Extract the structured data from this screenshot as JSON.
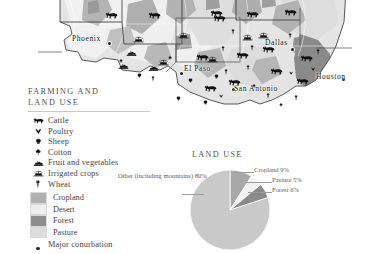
{
  "map": {
    "name": "southwest-usa-farming-map",
    "cities": [
      {
        "name": "Phoenix",
        "x": 93,
        "y": 40
      },
      {
        "name": "El Paso",
        "x": 186,
        "y": 70
      },
      {
        "name": "Dallas",
        "x": 275,
        "y": 44
      },
      {
        "name": "San Antonio",
        "x": 237,
        "y": 91
      },
      {
        "name": "Houston",
        "x": 319,
        "y": 77
      }
    ],
    "icons": [
      {
        "kind": "cattle",
        "x": 105,
        "y": 6
      },
      {
        "kind": "cattle",
        "x": 148,
        "y": 6
      },
      {
        "kind": "cattle",
        "x": 210,
        "y": 4
      },
      {
        "kind": "cattle",
        "x": 246,
        "y": 5
      },
      {
        "kind": "cattle",
        "x": 284,
        "y": 3
      },
      {
        "kind": "cattle",
        "x": 213,
        "y": 9
      },
      {
        "kind": "cattle",
        "x": 196,
        "y": 48
      },
      {
        "kind": "cattle",
        "x": 236,
        "y": 46
      },
      {
        "kind": "cattle",
        "x": 262,
        "y": 40
      },
      {
        "kind": "cattle",
        "x": 300,
        "y": 49
      },
      {
        "kind": "cattle",
        "x": 270,
        "y": 62
      },
      {
        "kind": "cattle",
        "x": 296,
        "y": 72
      },
      {
        "kind": "cattle",
        "x": 228,
        "y": 73
      },
      {
        "kind": "cattle",
        "x": 204,
        "y": 79
      },
      {
        "kind": "irrigated",
        "x": 133,
        "y": 30
      },
      {
        "kind": "irrigated",
        "x": 178,
        "y": 26
      },
      {
        "kind": "irrigated",
        "x": 242,
        "y": 28
      },
      {
        "kind": "irrigated",
        "x": 258,
        "y": 26
      },
      {
        "kind": "irrigated",
        "x": 207,
        "y": 50
      },
      {
        "kind": "irrigated",
        "x": 158,
        "y": 53
      },
      {
        "kind": "fruit",
        "x": 126,
        "y": 43
      },
      {
        "kind": "fruit",
        "x": 118,
        "y": 56
      },
      {
        "kind": "fruit",
        "x": 148,
        "y": 58
      },
      {
        "kind": "wheat",
        "x": 231,
        "y": 22
      },
      {
        "kind": "wheat",
        "x": 250,
        "y": 38
      },
      {
        "kind": "wheat",
        "x": 221,
        "y": 39
      },
      {
        "kind": "wheat",
        "x": 288,
        "y": 26
      },
      {
        "kind": "wheat",
        "x": 246,
        "y": 58
      },
      {
        "kind": "wheat",
        "x": 224,
        "y": 62
      },
      {
        "kind": "wheat",
        "x": 266,
        "y": 86
      },
      {
        "kind": "wheat",
        "x": 294,
        "y": 88
      },
      {
        "kind": "wheat",
        "x": 151,
        "y": 69
      },
      {
        "kind": "wheat",
        "x": 316,
        "y": 42
      },
      {
        "kind": "sheep",
        "x": 214,
        "y": 66
      },
      {
        "kind": "sheep",
        "x": 188,
        "y": 70
      },
      {
        "kind": "sheep",
        "x": 176,
        "y": 88
      },
      {
        "kind": "sheep",
        "x": 203,
        "y": 92
      },
      {
        "kind": "sheep",
        "x": 137,
        "y": 65
      },
      {
        "kind": "cotton",
        "x": 119,
        "y": 50
      },
      {
        "kind": "cotton",
        "x": 168,
        "y": 47
      },
      {
        "kind": "cotton",
        "x": 252,
        "y": 75
      },
      {
        "kind": "cotton",
        "x": 279,
        "y": 94
      },
      {
        "kind": "poultry",
        "x": 311,
        "y": 58
      },
      {
        "kind": "poultry",
        "x": 289,
        "y": 62
      },
      {
        "kind": "poultry",
        "x": 219,
        "y": 85
      }
    ]
  },
  "legend": {
    "title_line1": "FARMING AND",
    "title_line2": "LAND USE",
    "symbols": [
      {
        "icon": "cattle-icon",
        "label": "Cattle"
      },
      {
        "icon": "poultry-icon",
        "label": "Poultry"
      },
      {
        "icon": "sheep-icon",
        "label": "Sheep"
      },
      {
        "icon": "cotton-icon",
        "label": "Cotton"
      },
      {
        "icon": "fruit-icon",
        "label": "Fruit and vegetables"
      },
      {
        "icon": "irrigated-crops-icon",
        "label": "Irrigated crops"
      },
      {
        "icon": "wheat-icon",
        "label": "Wheat"
      }
    ],
    "areas": [
      {
        "label": "Cropland",
        "color": "#b0b0b0"
      },
      {
        "label": "Desert",
        "color": "#efefef"
      },
      {
        "label": "Forest",
        "color": "#8d8d8d"
      },
      {
        "label": "Pasture",
        "color": "#dcdcdc"
      }
    ],
    "conurbation_label": "Major conurbation"
  },
  "chart_data": {
    "type": "pie",
    "title": "LAND USE",
    "categories": [
      "Other (including mountains)",
      "Cropland",
      "Pasture",
      "Forest"
    ],
    "values": [
      80,
      9,
      5,
      6
    ],
    "labels": [
      "Other (including mountains) 80%",
      "Cropland 9%",
      "Pasture 5%",
      "Forest 6%"
    ],
    "colors": [
      "#c9c9c9",
      "#a8a8a8",
      "#f2f2f2",
      "#8a8a8a"
    ],
    "legend_position": "callouts",
    "grid": false
  }
}
